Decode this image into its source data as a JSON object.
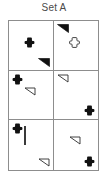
{
  "title": "Set A",
  "grid": {
    "columns": 2,
    "rows": 3,
    "border_color": "#8d8d8d",
    "fill_black": "#111111",
    "fill_white": "#ffffff",
    "cells": [
      {
        "id": "cell-1",
        "position": "top-left",
        "shapes": [
          {
            "slot": "top-left",
            "shape": "square",
            "fill": "black"
          },
          {
            "slot": "center",
            "shape": "cross",
            "fill": "black"
          },
          {
            "slot": "bottom-right",
            "shape": "triangle",
            "fill": "black"
          }
        ]
      },
      {
        "id": "cell-2",
        "position": "top-right",
        "shapes": [
          {
            "slot": "top-left",
            "shape": "triangle",
            "fill": "black"
          },
          {
            "slot": "center",
            "shape": "cross",
            "fill": "white"
          },
          {
            "slot": "bottom-right",
            "shape": "square",
            "fill": "black"
          }
        ]
      },
      {
        "id": "cell-3",
        "position": "middle-left",
        "shapes": [
          {
            "slot": "top-left",
            "shape": "cross",
            "fill": "black"
          },
          {
            "slot": "center",
            "shape": "triangle",
            "fill": "white"
          },
          {
            "slot": "bottom-right",
            "shape": "square",
            "fill": "black"
          }
        ]
      },
      {
        "id": "cell-4",
        "position": "middle-right",
        "shapes": [
          {
            "slot": "top-left",
            "shape": "triangle",
            "fill": "white"
          },
          {
            "slot": "center",
            "shape": "square",
            "fill": "black"
          },
          {
            "slot": "bottom-right",
            "shape": "cross",
            "fill": "black"
          }
        ]
      },
      {
        "id": "cell-5",
        "position": "bottom-left",
        "shapes": [
          {
            "slot": "top-left",
            "shape": "cross",
            "fill": "black"
          },
          {
            "slot": "center",
            "shape": "square",
            "fill": "white"
          },
          {
            "slot": "bottom-right",
            "shape": "triangle",
            "fill": "white"
          }
        ]
      },
      {
        "id": "cell-6",
        "position": "bottom-right",
        "shapes": [
          {
            "slot": "top-left",
            "shape": "square",
            "fill": "black"
          },
          {
            "slot": "center",
            "shape": "triangle",
            "fill": "white"
          },
          {
            "slot": "bottom-right",
            "shape": "cross",
            "fill": "black"
          }
        ]
      }
    ]
  }
}
